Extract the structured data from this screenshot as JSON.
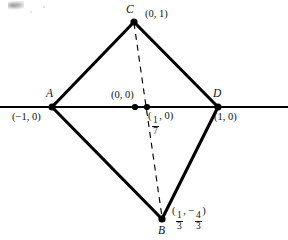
{
  "figure": {
    "type": "geometry-diagram",
    "background_color": "#ffffff",
    "stroke_color": "#000000",
    "axis": {
      "name": "x-axis",
      "orientation": "horizontal",
      "y_pixel": 107,
      "x_start_pixel": 0,
      "x_end_pixel": 288
    },
    "vertices": [
      {
        "id": "A",
        "point_label": "A",
        "coord_label": "(−1, 0)",
        "coords": [
          -1,
          0
        ],
        "px": 52,
        "py": 107,
        "label_pos": "above",
        "coord_pos": "below-left"
      },
      {
        "id": "C",
        "point_label": "C",
        "coord_label": "(0, 1)",
        "coords": [
          0,
          1
        ],
        "px": 134,
        "py": 22,
        "label_pos": "above-left",
        "coord_pos": "right"
      },
      {
        "id": "D",
        "point_label": "D",
        "coord_label": "(1, 0)",
        "coords": [
          1,
          0
        ],
        "px": 218,
        "py": 107,
        "label_pos": "above",
        "coord_pos": "below-right"
      },
      {
        "id": "B",
        "point_label": "B",
        "coord_label": "(1/3, −4/3)",
        "coord_parts": {
          "open": "(",
          "num1": "1",
          "den1": "3",
          "sep": ",",
          "sign2": "−",
          "num2": "4",
          "den2": "3",
          "close": ")"
        },
        "coords": [
          0.3333,
          -1.3333
        ],
        "px": 162,
        "py": 219,
        "label_pos": "below",
        "coord_pos": "right"
      }
    ],
    "marked_points": [
      {
        "id": "origin",
        "coord_label": "(0, 0)",
        "coords": [
          0,
          0
        ],
        "px": 135,
        "py": 107,
        "label_pos": "above-left"
      },
      {
        "id": "one-seventh",
        "coord_label": "(1/7, 0)",
        "coord_parts": {
          "open": "(",
          "num1": "1",
          "den1": "7",
          "rest": ", 0)"
        },
        "coords": [
          0.142857,
          0
        ],
        "px": 147,
        "py": 107,
        "label_pos": "below-right"
      }
    ],
    "edges": [
      {
        "name": "edge-A-C",
        "from": "A",
        "to": "C",
        "style": "solid"
      },
      {
        "name": "edge-C-D",
        "from": "C",
        "to": "D",
        "style": "solid"
      },
      {
        "name": "edge-D-B",
        "from": "D",
        "to": "B",
        "style": "solid"
      },
      {
        "name": "edge-B-A",
        "from": "B",
        "to": "A",
        "style": "solid"
      },
      {
        "name": "edge-A-D-axis",
        "from": "A",
        "to": "D",
        "style": "solid"
      },
      {
        "name": "diagonal-C-B",
        "from": "C",
        "to": "B",
        "style": "dashed"
      }
    ],
    "labels": {
      "A_point": "A",
      "A_coord": "(−1, 0)",
      "C_point": "C",
      "C_coord": "(0, 1)",
      "D_point": "D",
      "D_coord": "(1, 0)",
      "B_point": "B",
      "origin_coord": "(0, 0)",
      "seventh_rest": ", 0)",
      "seventh_open": "(",
      "seventh_num": "1",
      "seventh_den": "7",
      "b_open": "(",
      "b_num1": "1",
      "b_den1": "3",
      "b_sep": ",",
      "b_sign": "−",
      "b_num2": "4",
      "b_den2": "3",
      "b_close": ")"
    }
  }
}
